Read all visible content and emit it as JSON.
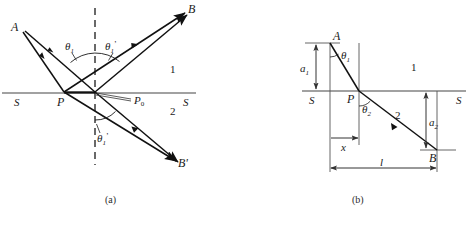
{
  "figure": {
    "panels": [
      {
        "id": "a",
        "caption": "(a)",
        "labels": {
          "source_point": "A",
          "reflected_point": "B",
          "refracted_point": "B'",
          "incidence_point": "P",
          "normal_foot_point": "P₀",
          "interface_left": "S",
          "interface_right": "S",
          "medium_upper": "1",
          "medium_lower": "2",
          "angle_incidence": "θ",
          "angle_incidence_sub": "1",
          "angle_reflection": "θ",
          "angle_reflection_sub": "1",
          "angle_reflection_prime": "'",
          "angle_refraction": "θ",
          "angle_refraction_sub": "1",
          "angle_refraction_prime": "'",
          "point_B_prime_mark": "'"
        }
      },
      {
        "id": "b",
        "caption": "(b)",
        "labels": {
          "source_point": "A",
          "target_point": "B",
          "incidence_point": "P",
          "interface_left": "S",
          "interface_right": "S",
          "medium_upper": "1",
          "medium_lower": "2",
          "angle_incidence": "θ",
          "angle_incidence_sub": "1",
          "angle_refraction": "θ",
          "angle_refraction_sub": "2",
          "height_upper": "a",
          "height_upper_sub": "1",
          "height_lower": "a",
          "height_lower_sub": "2",
          "horiz_partial": "x",
          "horiz_total": "l"
        }
      }
    ],
    "colors": {
      "ray": "#111111",
      "interface": "#444444",
      "dashed_normal": "#1a1a1a",
      "dimension": "#333333",
      "text": "#1a1a1a",
      "background": "#ffffff"
    }
  }
}
